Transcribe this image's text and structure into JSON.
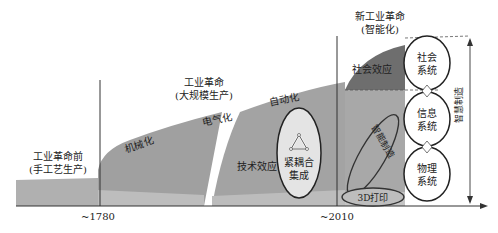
{
  "diagram": {
    "eras": [
      {
        "title": "工业革命前",
        "subtitle": "(手工艺生产)"
      },
      {
        "title": "工业革命",
        "subtitle": "(大规模生产)"
      },
      {
        "title": "新工业革命",
        "subtitle": "(智能化)"
      }
    ],
    "stages": {
      "mechanization": "机械化",
      "electrification": "电气化",
      "automation": "自动化",
      "tech_effect": "技术效应",
      "social_effect": "社会效应"
    },
    "tight_coupling": {
      "line1": "紧耦合",
      "line2": "集成"
    },
    "smart_manufacturing_diag": "智能制造",
    "printing_3d": "3D打印",
    "systems": [
      {
        "line1": "社会",
        "line2": "系统"
      },
      {
        "line1": "信息",
        "line2": "系统"
      },
      {
        "line1": "物理",
        "line2": "系统"
      }
    ],
    "vertical_label": "智慧制造",
    "axis_ticks": [
      "~1780",
      "~2010"
    ],
    "colors": {
      "dark_band": "#707070",
      "mid_band": "#a6a6a6",
      "light_band": "#c8c8c8",
      "ellipse_fill": "#e6e6e6"
    }
  }
}
